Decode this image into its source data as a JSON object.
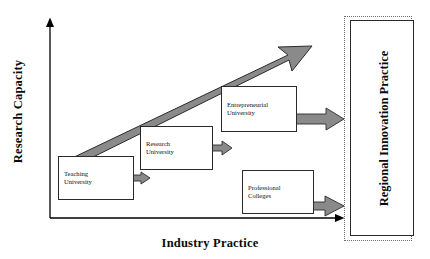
{
  "figure": {
    "type": "conceptual-diagram",
    "background_color": "#ffffff"
  },
  "axes": {
    "y": {
      "label": "Research Capacity",
      "orientation": "vertical",
      "arrow": "up",
      "color": "#000000"
    },
    "x": {
      "label": "Industry Practice",
      "orientation": "horizontal",
      "arrow": "right",
      "color": "#000000"
    }
  },
  "trend_arrow": {
    "name": "growth-trend-arrow",
    "from": "Teaching University",
    "to": "Entrepreneurial University",
    "direction": "up-right",
    "fill_color": "#808080",
    "stroke_color": "#2b2b2b"
  },
  "nodes": [
    {
      "id": "teaching",
      "label": "Teaching\nUniversity",
      "line1": "Teaching",
      "line2": "University",
      "border_color": "#2a2a2a",
      "fill_color": "#ffffff"
    },
    {
      "id": "research",
      "label": "Research\nUniversity",
      "line1": "Research",
      "line2": "University",
      "border_color": "#2a2a2a",
      "fill_color": "#ffffff"
    },
    {
      "id": "entrepreneurial",
      "label": "Entrepreneurial\nUniversity",
      "line1": "Entrepreneurial",
      "line2": "University",
      "border_color": "#2a2a2a",
      "fill_color": "#ffffff"
    },
    {
      "id": "professional",
      "label": "Professional\nColleges",
      "line1": "Professional",
      "line2": "Colleges",
      "border_color": "#2a2a2a",
      "fill_color": "#ffffff"
    }
  ],
  "flow_arrows": [
    {
      "id": "teaching-out",
      "from": "Teaching University",
      "fill_color": "#808080"
    },
    {
      "id": "research-out",
      "from": "Research University",
      "fill_color": "#808080"
    },
    {
      "id": "entrepreneurial-out",
      "from": "Entrepreneurial University",
      "fill_color": "#808080"
    },
    {
      "id": "professional-out",
      "from": "Professional Colleges",
      "fill_color": "#808080"
    }
  ],
  "panel": {
    "label": "Regional Innovation Practice",
    "outer_border_style": "dotted",
    "outer_border_color": "#6d6d6d",
    "inner_border_style": "solid",
    "inner_border_color": "#2a2a2a"
  }
}
